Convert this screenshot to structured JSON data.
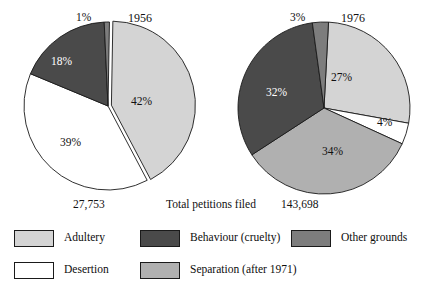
{
  "figure": {
    "caption_center": "Total petitions filed"
  },
  "colors": {
    "adultery": "#d4d4d4",
    "desertion": "#ffffff",
    "behaviour": "#4a4a4a",
    "separation": "#b0b0b0",
    "other": "#7d7d7d",
    "outline": "#1a1a1a",
    "background": "#ffffff"
  },
  "charts": [
    {
      "id": "pie-1956",
      "year": "1956",
      "total": "27,753",
      "slices": [
        {
          "key": "adultery",
          "label": "Adultery",
          "pct_text": "42%",
          "value": 42,
          "color": "#d4d4d4"
        },
        {
          "key": "desertion",
          "label": "Desertion",
          "pct_text": "39%",
          "value": 39,
          "color": "#ffffff"
        },
        {
          "key": "behaviour",
          "label": "Behaviour (cruelty)",
          "pct_text": "18%",
          "value": 18,
          "color": "#4a4a4a"
        },
        {
          "key": "other",
          "label": "Other grounds",
          "pct_text": "1%",
          "value": 1,
          "color": "#7d7d7d"
        }
      ]
    },
    {
      "id": "pie-1976",
      "year": "1976",
      "total": "143,698",
      "slices": [
        {
          "key": "adultery",
          "label": "Adultery",
          "pct_text": "27%",
          "value": 27,
          "color": "#d4d4d4"
        },
        {
          "key": "desertion",
          "label": "Desertion",
          "pct_text": "4%",
          "value": 4,
          "color": "#ffffff"
        },
        {
          "key": "separation",
          "label": "Separation (after 1971)",
          "pct_text": "34%",
          "value": 34,
          "color": "#b0b0b0"
        },
        {
          "key": "behaviour",
          "label": "Behaviour (cruelty)",
          "pct_text": "32%",
          "value": 32,
          "color": "#4a4a4a"
        },
        {
          "key": "other",
          "label": "Other grounds",
          "pct_text": "3%",
          "value": 3,
          "color": "#7d7d7d"
        }
      ]
    }
  ],
  "legend": [
    {
      "label": "Adultery",
      "color": "#d4d4d4"
    },
    {
      "label": "Behaviour (cruelty)",
      "color": "#4a4a4a"
    },
    {
      "label": "Other grounds",
      "color": "#7d7d7d"
    },
    {
      "label": "Desertion",
      "color": "#ffffff"
    },
    {
      "label": "Separation (after 1971)",
      "color": "#b0b0b0"
    }
  ],
  "chart_data": {
    "type": "pie",
    "xlabel": "",
    "ylabel": "",
    "center_caption": "Total petitions filed",
    "legend_position": "bottom",
    "grid": false,
    "units": "percent of petitions filed",
    "categories": [
      "Adultery",
      "Desertion",
      "Behaviour (cruelty)",
      "Separation (after 1971)",
      "Other grounds"
    ],
    "series": [
      {
        "name": "1956",
        "total_label": "27,753",
        "total": 27753,
        "values": [
          42,
          39,
          18,
          0,
          1
        ],
        "labels": [
          "42%",
          "39%",
          "18%",
          "",
          "1%"
        ]
      },
      {
        "name": "1976",
        "total_label": "143,698",
        "total": 143698,
        "values": [
          27,
          4,
          32,
          34,
          3
        ],
        "labels": [
          "27%",
          "4%",
          "32%",
          "34%",
          "3%"
        ]
      }
    ]
  }
}
